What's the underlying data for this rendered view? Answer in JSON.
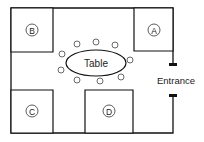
{
  "diagram": {
    "type": "floor-plan",
    "table_label": "Table",
    "entrance_label": "Entrance",
    "rooms": [
      {
        "label": "A",
        "position": "top-right"
      },
      {
        "label": "B",
        "position": "top-left"
      },
      {
        "label": "C",
        "position": "bottom-left"
      },
      {
        "label": "D",
        "position": "bottom-center"
      }
    ],
    "chair_count": 9
  }
}
